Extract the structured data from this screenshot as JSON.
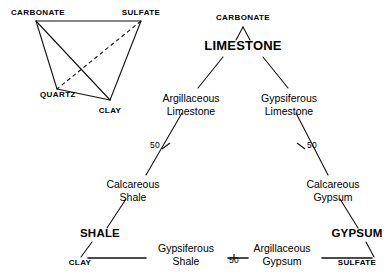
{
  "figure": {
    "ink_color": "#111111",
    "background_color": "#ffffff"
  },
  "tetrahedron": {
    "name": "composition-tetrahedron",
    "vertices": [
      {
        "id": "carbonate",
        "label": "CARBONATE",
        "x": 36,
        "y": 21,
        "label_x": 38,
        "label_y": 15,
        "anchor": "middle"
      },
      {
        "id": "sulfate",
        "label": "SULFATE",
        "x": 141,
        "y": 21,
        "label_x": 141,
        "label_y": 15,
        "anchor": "middle"
      },
      {
        "id": "quartz",
        "label": "QUARTZ",
        "x": 57,
        "y": 89,
        "label_x": 40,
        "label_y": 97,
        "anchor": "start"
      },
      {
        "id": "clay",
        "label": "CLAY",
        "x": 110,
        "y": 100,
        "label_x": 110,
        "label_y": 113,
        "anchor": "middle"
      }
    ],
    "solid_edges": [
      {
        "from": "carbonate",
        "to": "sulfate"
      },
      {
        "from": "carbonate",
        "to": "quartz"
      },
      {
        "from": "carbonate",
        "to": "clay"
      },
      {
        "from": "sulfate",
        "to": "clay"
      },
      {
        "from": "quartz",
        "to": "clay"
      }
    ],
    "dashed_edges": [
      {
        "from": "sulfate",
        "to": "quartz"
      }
    ]
  },
  "tree": {
    "name": "lithology-classification-tree",
    "nodes": [
      {
        "id": "carbonate-top",
        "line1": "CARBONATE",
        "line2": "",
        "style": "caps-small",
        "x": 243,
        "y": 20,
        "anchor": "middle"
      },
      {
        "id": "limestone",
        "line1": "LIMESTONE",
        "line2": "",
        "style": "caps-big",
        "x": 243,
        "y": 50,
        "anchor": "middle"
      },
      {
        "id": "argillaceous-ls",
        "line1": "Argillaceous",
        "line2": "Limestone",
        "style": "normal",
        "x": 191,
        "y": 102,
        "anchor": "middle"
      },
      {
        "id": "gypsiferous-ls",
        "line1": "Gypsiferous",
        "line2": "Limestone",
        "style": "normal",
        "x": 289,
        "y": 102,
        "anchor": "middle"
      },
      {
        "id": "calcareous-shale",
        "line1": "Calcareous",
        "line2": "Shale",
        "style": "normal",
        "x": 133,
        "y": 188,
        "anchor": "middle"
      },
      {
        "id": "calcareous-gypsum",
        "line1": "Calcareous",
        "line2": "Gypsum",
        "style": "normal",
        "x": 333,
        "y": 188,
        "anchor": "middle"
      },
      {
        "id": "shale",
        "line1": "SHALE",
        "line2": "",
        "style": "caps-mid",
        "x": 100,
        "y": 237,
        "anchor": "middle"
      },
      {
        "id": "gypsum",
        "line1": "GYPSUM",
        "line2": "",
        "style": "caps-mid",
        "x": 357,
        "y": 237,
        "anchor": "middle"
      },
      {
        "id": "gypsiferous-shale",
        "line1": "Gypsiferous",
        "line2": "Shale",
        "style": "normal",
        "x": 186,
        "y": 252,
        "anchor": "middle"
      },
      {
        "id": "argillaceous-gyp",
        "line1": "Argillaceous",
        "line2": "Gypsum",
        "style": "normal",
        "x": 282,
        "y": 252,
        "anchor": "middle"
      },
      {
        "id": "clay-end",
        "line1": "CLAY",
        "line2": "",
        "style": "caps-small",
        "x": 80,
        "y": 265,
        "anchor": "middle"
      },
      {
        "id": "sulfate-end",
        "line1": "SULFATE",
        "line2": "",
        "style": "caps-small",
        "x": 357,
        "y": 265,
        "anchor": "middle"
      }
    ],
    "branch_labels": [
      {
        "id": "tick-left-50",
        "value": "50",
        "x": 160,
        "y": 148,
        "anchor": "end"
      },
      {
        "id": "tick-right-50",
        "value": "50",
        "x": 307,
        "y": 148,
        "anchor": "start"
      },
      {
        "id": "tick-bottom-50",
        "value": "50",
        "x": 234,
        "y": 263,
        "anchor": "middle"
      }
    ],
    "edges": [
      {
        "id": "carbonate-to-limestone-left",
        "x1": 236,
        "y1": 40,
        "x2": 243,
        "y2": 27
      },
      {
        "id": "carbonate-to-limestone-right",
        "x1": 250,
        "y1": 40,
        "x2": 243,
        "y2": 27
      },
      {
        "id": "limestone-to-argillaceous",
        "x1": 223,
        "y1": 57,
        "x2": 198,
        "y2": 88
      },
      {
        "id": "limestone-to-gypsiferous",
        "x1": 263,
        "y1": 57,
        "x2": 288,
        "y2": 88
      },
      {
        "id": "argillaceous-to-calcshale",
        "x1": 182,
        "y1": 113,
        "x2": 146,
        "y2": 175
      },
      {
        "id": "gypsiferous-to-calcgypsum",
        "x1": 296,
        "y1": 113,
        "x2": 328,
        "y2": 175
      },
      {
        "id": "calcshale-to-shale",
        "x1": 126,
        "y1": 199,
        "x2": 107,
        "y2": 228
      },
      {
        "id": "calcgypsum-to-gypsum",
        "x1": 340,
        "y1": 199,
        "x2": 358,
        "y2": 228
      },
      {
        "id": "shale-to-clay",
        "x1": 92,
        "y1": 242,
        "x2": 81,
        "y2": 257
      },
      {
        "id": "gypsum-to-sulfate",
        "x1": 366,
        "y1": 242,
        "x2": 374,
        "y2": 257
      },
      {
        "id": "baseline-clay-gypsshale",
        "x1": 88,
        "y1": 258,
        "x2": 146,
        "y2": 258
      },
      {
        "id": "baseline-gypsshale-50",
        "x1": 228,
        "y1": 258,
        "x2": 248,
        "y2": 258
      },
      {
        "id": "baseline-argilgyp-sulfate",
        "x1": 322,
        "y1": 258,
        "x2": 372,
        "y2": 258
      }
    ],
    "tick_marks": [
      {
        "id": "tick-mark-left",
        "x1": 162,
        "y1": 149,
        "x2": 170,
        "y2": 143
      },
      {
        "id": "tick-mark-right",
        "x1": 297,
        "y1": 143,
        "x2": 305,
        "y2": 149
      },
      {
        "id": "tick-mark-bottom",
        "x1": 234,
        "y1": 254,
        "x2": 234,
        "y2": 260
      }
    ]
  }
}
